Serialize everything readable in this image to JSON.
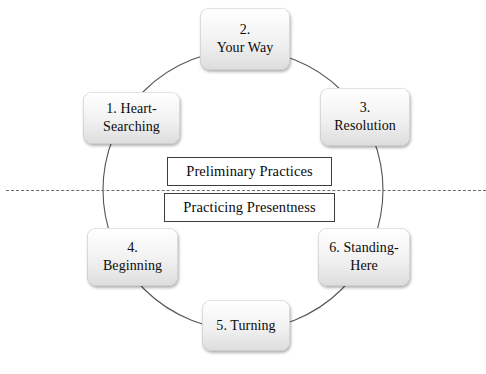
{
  "diagram": {
    "ring": {
      "center_x": 243,
      "center_y": 190,
      "radius": 140,
      "stroke_color": "#555555"
    },
    "divider": {
      "name": "dashed-divider-line",
      "style": "dashed",
      "color": "#6a6a6a"
    },
    "nodes": [
      {
        "id": "node-1",
        "label": "1. Heart-\nSearching"
      },
      {
        "id": "node-2",
        "label": "2.\nYour Way"
      },
      {
        "id": "node-3",
        "label": "3.\nResolution"
      },
      {
        "id": "node-4",
        "label": "4.\nBeginning"
      },
      {
        "id": "node-5",
        "label": "5. Turning"
      },
      {
        "id": "node-6",
        "label": "6. Standing-\nHere"
      }
    ],
    "center_boxes": [
      {
        "id": "box-preliminary",
        "label": "Preliminary Practices"
      },
      {
        "id": "box-presentness",
        "label": "Practicing Presentness"
      }
    ]
  }
}
